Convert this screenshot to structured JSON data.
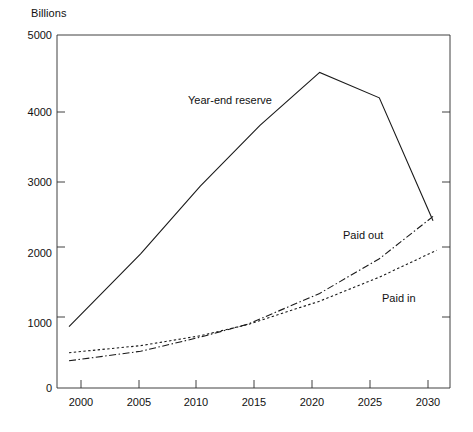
{
  "chart_data": {
    "type": "line",
    "title": "",
    "subtitle": "",
    "xlabel": "",
    "ylabel": "Billions",
    "unit_label": "Billions",
    "xlim": [
      1999,
      2030
    ],
    "ylim": [
      0,
      5000
    ],
    "grid": false,
    "legend_position": "inline-annotations",
    "xticks": [
      2000,
      2005,
      2010,
      2015,
      2020,
      2025,
      2030
    ],
    "xtick_labels": [
      "2000",
      "2005",
      "2010",
      "2015",
      "2020",
      "2025",
      "2030"
    ],
    "yticks": [
      0,
      1000,
      2000,
      3000,
      4000,
      5000
    ],
    "ytick_labels": [
      "0",
      "1000",
      "2000",
      "3000",
      "4000",
      "5000"
    ],
    "series": [
      {
        "name": "Year-end reserve",
        "label": "Year-end reserve",
        "style": "solid",
        "color": "#1a1a1a",
        "x": [
          1999,
          2005,
          2010,
          2015,
          2020,
          2025,
          2029.5
        ],
        "values": [
          870,
          1900,
          2860,
          3720,
          4470,
          4110,
          2370
        ]
      },
      {
        "name": "Paid out",
        "label": "Paid out",
        "style": "dash-dot",
        "color": "#1a1a1a",
        "x": [
          1999,
          2005,
          2010,
          2014,
          2020,
          2025,
          2029.5
        ],
        "values": [
          385,
          520,
          720,
          905,
          1340,
          1830,
          2430
        ]
      },
      {
        "name": "Paid in",
        "label": "Paid in",
        "style": "dotted",
        "color": "#1a1a1a",
        "x": [
          1999,
          2005,
          2010,
          2014,
          2020,
          2025,
          2029.8
        ],
        "values": [
          500,
          600,
          740,
          900,
          1230,
          1570,
          1950
        ]
      }
    ],
    "annotations": [
      {
        "text": "Year-end reserve",
        "x_px": 188,
        "y_px": 94
      },
      {
        "text": "Paid out",
        "x_px": 343,
        "y_px": 229
      },
      {
        "text": "Paid in",
        "x_px": 382,
        "y_px": 292
      }
    ],
    "axis_color": "#1a1a1a"
  }
}
